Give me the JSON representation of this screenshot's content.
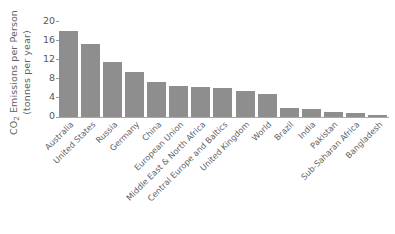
{
  "chart_data": {
    "type": "bar",
    "title": "",
    "xlabel": "",
    "ylabel": "CO2 Emissions per Person (tonnes per year)",
    "ylabel_line1": "CO",
    "ylabel_sub": "2",
    "ylabel_line1_rest": " Emissions per Person",
    "ylabel_line2": "(tonnes per year)",
    "ylim": [
      0,
      20
    ],
    "yticks": [
      0,
      4,
      8,
      12,
      16,
      20
    ],
    "ytick_labels": [
      "0",
      "4",
      "8",
      "12",
      "16",
      "20"
    ],
    "grid": false,
    "legend": "none",
    "bar_color": "#8e8e8e",
    "categories": [
      "Australia",
      "United States",
      "Russia",
      "Germany",
      "China",
      "European Union",
      "Middle East & North Africa",
      "Central Europe and Baltics",
      "United Kingdom",
      "World",
      "Brazil",
      "India",
      "Pakistan",
      "Sub-Saharan Africa",
      "Bangladesh"
    ],
    "values": [
      17.9,
      15.3,
      11.4,
      9.4,
      7.3,
      6.4,
      6.2,
      6.1,
      5.5,
      4.8,
      1.9,
      1.7,
      1.0,
      0.9,
      0.4
    ]
  },
  "caption": {
    "text": ""
  }
}
